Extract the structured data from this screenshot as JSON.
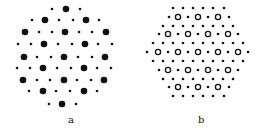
{
  "panels": [
    {
      "id": "a",
      "label": "a",
      "label_pos": [
        68,
        114
      ],
      "rows": [
        {
          "y": 9,
          "dots": [
            [
              52,
              "s"
            ],
            [
              66,
              "L"
            ],
            [
              80,
              "s"
            ]
          ]
        },
        {
          "y": 20,
          "dots": [
            [
              32,
              "s"
            ],
            [
              45,
              "L"
            ],
            [
              59,
              "s"
            ],
            [
              73,
              "s"
            ],
            [
              86,
              "L"
            ],
            [
              99,
              "s"
            ]
          ]
        },
        {
          "y": 32,
          "dots": [
            [
              25,
              "L"
            ],
            [
              39,
              "s"
            ],
            [
              52,
              "s"
            ],
            [
              65,
              "L"
            ],
            [
              79,
              "s"
            ],
            [
              92,
              "s"
            ],
            [
              106,
              "L"
            ]
          ]
        },
        {
          "y": 44,
          "dots": [
            [
              18,
              "s"
            ],
            [
              31,
              "s"
            ],
            [
              44,
              "L"
            ],
            [
              58,
              "s"
            ],
            [
              72,
              "s"
            ],
            [
              85,
              "L"
            ],
            [
              98,
              "s"
            ],
            [
              112,
              "s"
            ]
          ]
        },
        {
          "y": 57,
          "dots": [
            [
              24,
              "L"
            ],
            [
              37,
              "s"
            ],
            [
              51,
              "s"
            ],
            [
              64,
              "L"
            ],
            [
              78,
              "s"
            ],
            [
              92,
              "s"
            ],
            [
              105,
              "L"
            ]
          ]
        },
        {
          "y": 68,
          "dots": [
            [
              17,
              "s"
            ],
            [
              30,
              "s"
            ],
            [
              43,
              "L"
            ],
            [
              57,
              "s"
            ],
            [
              71,
              "s"
            ],
            [
              84,
              "L"
            ],
            [
              97,
              "s"
            ],
            [
              111,
              "s"
            ]
          ]
        },
        {
          "y": 80,
          "dots": [
            [
              23,
              "L"
            ],
            [
              37,
              "s"
            ],
            [
              50,
              "s"
            ],
            [
              64,
              "L"
            ],
            [
              77,
              "s"
            ],
            [
              91,
              "s"
            ],
            [
              104,
              "L"
            ]
          ]
        },
        {
          "y": 91,
          "dots": [
            [
              29,
              "s"
            ],
            [
              43,
              "L"
            ],
            [
              56,
              "s"
            ],
            [
              70,
              "s"
            ],
            [
              84,
              "L"
            ],
            [
              97,
              "s"
            ]
          ]
        },
        {
          "y": 104,
          "dots": [
            [
              49,
              "s"
            ],
            [
              62,
              "L"
            ],
            [
              76,
              "s"
            ]
          ]
        }
      ]
    },
    {
      "id": "b",
      "label": "b",
      "label_pos": [
        198,
        114
      ],
      "rows": [
        {
          "y": 8,
          "dots": [
            [
              173,
              "s"
            ],
            [
              183,
              "s"
            ],
            [
              193,
              "s"
            ],
            [
              203,
              "s"
            ],
            [
              213,
              "s"
            ],
            [
              224,
              "s"
            ]
          ]
        },
        {
          "y": 17,
          "dots": [
            [
              169,
              "s"
            ],
            [
              178,
              "O"
            ],
            [
              188,
              "s"
            ],
            [
              198,
              "O"
            ],
            [
              208,
              "s"
            ],
            [
              218,
              "O"
            ],
            [
              229,
              "s"
            ]
          ]
        },
        {
          "y": 26,
          "dots": [
            [
              163,
              "s"
            ],
            [
              173,
              "s"
            ],
            [
              183,
              "s"
            ],
            [
              193,
              "s"
            ],
            [
              203,
              "s"
            ],
            [
              213,
              "s"
            ],
            [
              223,
              "s"
            ],
            [
              233,
              "s"
            ]
          ]
        },
        {
          "y": 34,
          "dots": [
            [
              159,
              "s"
            ],
            [
              168,
              "O"
            ],
            [
              178,
              "s"
            ],
            [
              188,
              "O"
            ],
            [
              198,
              "s"
            ],
            [
              208,
              "O"
            ],
            [
              218,
              "s"
            ],
            [
              228,
              "O"
            ],
            [
              238,
              "s"
            ]
          ]
        },
        {
          "y": 43,
          "dots": [
            [
              153,
              "s"
            ],
            [
              163,
              "s"
            ],
            [
              173,
              "s"
            ],
            [
              183,
              "s"
            ],
            [
              193,
              "s"
            ],
            [
              203,
              "s"
            ],
            [
              213,
              "s"
            ],
            [
              223,
              "s"
            ],
            [
              233,
              "s"
            ],
            [
              243,
              "s"
            ]
          ]
        },
        {
          "y": 52,
          "dots": [
            [
              147,
              "s"
            ],
            [
              158,
              "O"
            ],
            [
              168,
              "s"
            ],
            [
              178,
              "O"
            ],
            [
              188,
              "s"
            ],
            [
              198,
              "O"
            ],
            [
              208,
              "s"
            ],
            [
              218,
              "O"
            ],
            [
              228,
              "s"
            ],
            [
              238,
              "O"
            ],
            [
              248,
              "s"
            ]
          ]
        },
        {
          "y": 61,
          "dots": [
            [
              153,
              "s"
            ],
            [
              163,
              "s"
            ],
            [
              173,
              "s"
            ],
            [
              183,
              "s"
            ],
            [
              193,
              "s"
            ],
            [
              203,
              "s"
            ],
            [
              213,
              "s"
            ],
            [
              223,
              "s"
            ],
            [
              233,
              "s"
            ],
            [
              243,
              "s"
            ]
          ]
        },
        {
          "y": 70,
          "dots": [
            [
              159,
              "s"
            ],
            [
              168,
              "O"
            ],
            [
              178,
              "s"
            ],
            [
              188,
              "O"
            ],
            [
              198,
              "s"
            ],
            [
              208,
              "O"
            ],
            [
              218,
              "s"
            ],
            [
              228,
              "O"
            ],
            [
              238,
              "s"
            ]
          ]
        },
        {
          "y": 79,
          "dots": [
            [
              163,
              "s"
            ],
            [
              173,
              "s"
            ],
            [
              183,
              "s"
            ],
            [
              193,
              "s"
            ],
            [
              203,
              "s"
            ],
            [
              213,
              "s"
            ],
            [
              223,
              "s"
            ],
            [
              233,
              "s"
            ]
          ]
        },
        {
          "y": 87,
          "dots": [
            [
              169,
              "s"
            ],
            [
              178,
              "O"
            ],
            [
              188,
              "s"
            ],
            [
              198,
              "O"
            ],
            [
              208,
              "s"
            ],
            [
              218,
              "O"
            ],
            [
              229,
              "s"
            ]
          ]
        },
        {
          "y": 96,
          "dots": [
            [
              173,
              "s"
            ],
            [
              183,
              "s"
            ],
            [
              193,
              "s"
            ],
            [
              203,
              "s"
            ],
            [
              213,
              "s"
            ],
            [
              224,
              "s"
            ]
          ]
        }
      ]
    }
  ]
}
